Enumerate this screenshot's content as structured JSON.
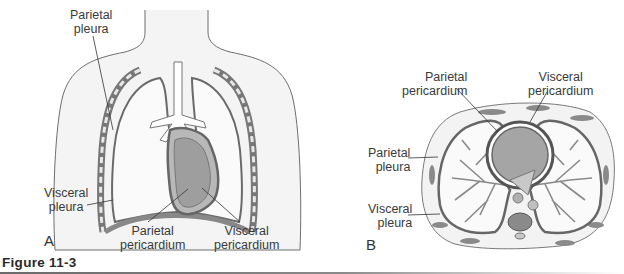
{
  "figure": {
    "caption": "Figure 11-3",
    "panels": [
      {
        "id": "A",
        "letter": "A",
        "view": "anterior thorax",
        "labels": {
          "parietal_pleura": [
            "Parietal",
            "pleura"
          ],
          "visceral_pleura": [
            "Visceral",
            "pleura"
          ],
          "parietal_pericardium": [
            "Parietal",
            "pericardium"
          ],
          "visceral_pericardium": [
            "Visceral",
            "pericardium"
          ]
        }
      },
      {
        "id": "B",
        "letter": "B",
        "view": "transverse section",
        "labels": {
          "parietal_pericardium": [
            "Parietal",
            "pericardium"
          ],
          "visceral_pericardium": [
            "Visceral",
            "pericardium"
          ],
          "parietal_pleura": [
            "Parietal",
            "pleura"
          ],
          "visceral_pleura": [
            "Visceral",
            "pleura"
          ]
        }
      }
    ]
  },
  "colors": {
    "body_fill": "#f2f2f2",
    "outline": "#6a6a6a",
    "membrane": "#7d7d7d",
    "heart": "#9a9a9a",
    "bronchi": "#8c8c8c",
    "text": "#3a3a3a"
  }
}
